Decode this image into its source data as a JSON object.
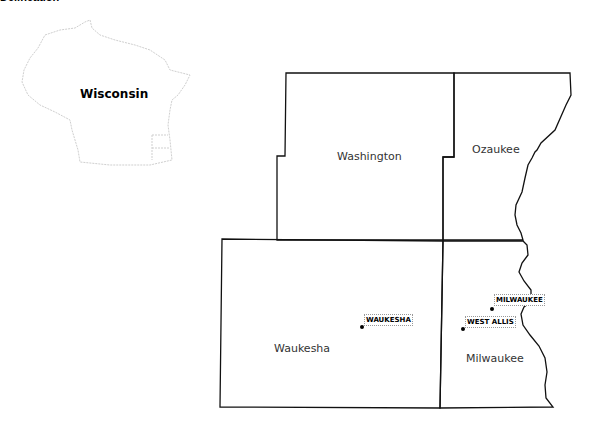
{
  "title": "Delineation",
  "inset": {
    "state_label": "Wisconsin"
  },
  "counties": [
    {
      "name": "Washington"
    },
    {
      "name": "Ozaukee"
    },
    {
      "name": "Waukesha"
    },
    {
      "name": "Milwaukee"
    }
  ],
  "cities": [
    {
      "name": "WAUKESHA"
    },
    {
      "name": "MILWAUKEE"
    },
    {
      "name": "WEST ALLIS"
    }
  ],
  "colors": {
    "border": "#111111",
    "inset_outline": "#cccccc",
    "background": "#ffffff"
  }
}
